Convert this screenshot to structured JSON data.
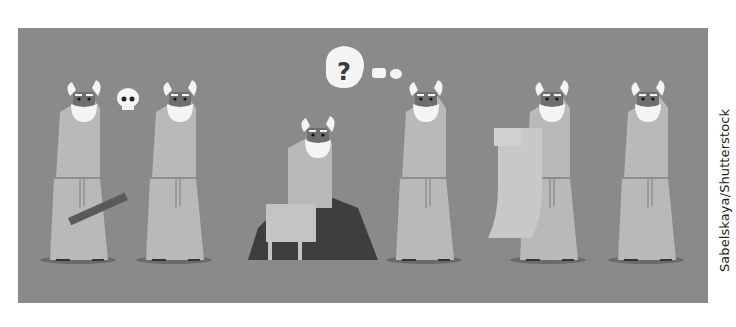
{
  "illustration": {
    "description": "Cartoon sequence of a bearded philosopher in a robe: holding a stick, contemplating a skull, sitting on a rock, thinking with a question mark, reading a scroll, and walking away",
    "background_color": "#8a8a8a",
    "robe_color": "#b9b9b9",
    "beard_color": "#f4f4f4",
    "rock_color": "#3e3e3e",
    "thought_bubble_text": "?",
    "figures": [
      {
        "pose": "standing-with-stick"
      },
      {
        "pose": "standing-with-skull"
      },
      {
        "pose": "sitting-on-rock"
      },
      {
        "pose": "thinking-question"
      },
      {
        "pose": "reading-scroll"
      },
      {
        "pose": "standing-walking"
      }
    ]
  },
  "credit": {
    "text": "Sabelskaya/Shutterstock"
  }
}
